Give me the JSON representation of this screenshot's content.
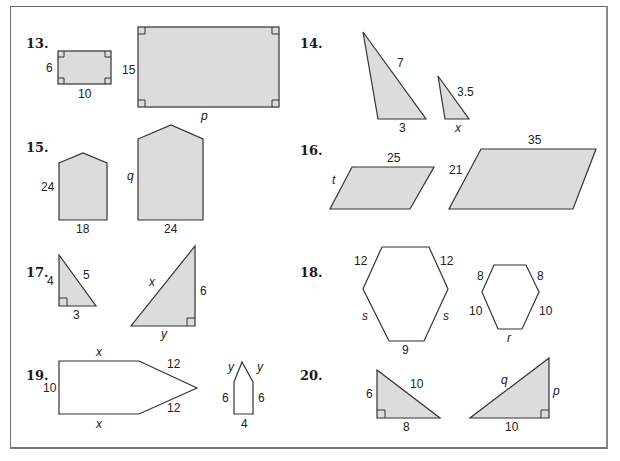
{
  "colors": {
    "shape_fill": "#dcdcdc",
    "stroke": "#333333",
    "background": "#ffffff"
  },
  "problems": [
    {
      "number": "13.",
      "shapes": "rectangles",
      "small": {
        "width": "10",
        "height": "6"
      },
      "large": {
        "width": "p",
        "height": "15"
      }
    },
    {
      "number": "14.",
      "shapes": "triangles",
      "small": {
        "side": "3.5",
        "base": "x"
      },
      "large": {
        "side": "7",
        "base": "3"
      }
    },
    {
      "number": "15.",
      "shapes": "pentagons",
      "small": {
        "height": "24",
        "base": "18"
      },
      "large": {
        "height": "q",
        "base": "24"
      }
    },
    {
      "number": "16.",
      "shapes": "parallelograms",
      "small": {
        "top": "25",
        "side": "t"
      },
      "large": {
        "top": "35",
        "side": "21"
      }
    },
    {
      "number": "17.",
      "shapes": "right-triangles",
      "small": {
        "leg_vertical": "4",
        "hypotenuse": "5",
        "leg_horizontal": "3"
      },
      "large": {
        "leg_vertical": "6",
        "hypotenuse": "x",
        "leg_horizontal": "y"
      }
    },
    {
      "number": "18.",
      "shapes": "hexagons",
      "large": {
        "top_left": "12",
        "top_right": "12",
        "bottom_left": "s",
        "bottom_right": "s",
        "bottom": "9"
      },
      "small": {
        "top_left": "8",
        "top_right": "8",
        "bottom_left": "10",
        "bottom_right": "10",
        "bottom": "r"
      }
    },
    {
      "number": "19.",
      "shapes": "pentagons",
      "large": {
        "top": "x",
        "bottom": "x",
        "left": "10",
        "upper_slant": "12",
        "lower_slant": "12"
      },
      "small": {
        "left_slant": "y",
        "right_slant": "y",
        "left": "6",
        "right": "6",
        "base": "4"
      }
    },
    {
      "number": "20.",
      "shapes": "right-triangles",
      "small": {
        "leg_vertical": "6",
        "hypotenuse": "10",
        "leg_horizontal": "8"
      },
      "large": {
        "leg_vertical": "p",
        "hypotenuse": "q",
        "leg_horizontal": "10"
      }
    }
  ]
}
